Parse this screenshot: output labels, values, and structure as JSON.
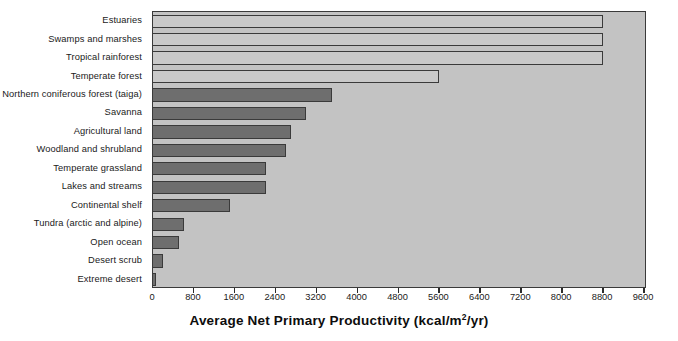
{
  "chart_data": {
    "type": "bar",
    "orientation": "horizontal",
    "title": "",
    "xlabel": "Average Net Primary Productivity (kcal/m2/yr)",
    "xlabel_parts": {
      "before": "Average Net Primary Productivity (kcal/m",
      "sup": "2",
      "after": "/yr)"
    },
    "ylabel": "",
    "categories": [
      "Estuaries",
      "Swamps and marshes",
      "Tropical rainforest",
      "Temperate forest",
      "Northern coniferous forest (taiga)",
      "Savanna",
      "Agricultural land",
      "Woodland and shrubland",
      "Temperate grassland",
      "Lakes and streams",
      "Continental shelf",
      "Tundra (arctic and alpine)",
      "Open ocean",
      "Desert scrub",
      "Extreme desert"
    ],
    "values": [
      8800,
      8800,
      8800,
      5600,
      3500,
      3000,
      2700,
      2600,
      2200,
      2200,
      1500,
      600,
      500,
      200,
      50
    ],
    "bar_styles": [
      "light",
      "light",
      "light",
      "light",
      "dark",
      "dark",
      "dark",
      "dark",
      "dark",
      "dark",
      "dark",
      "dark",
      "dark",
      "dark",
      "dark"
    ],
    "xlim": [
      0,
      9600
    ],
    "xticks": [
      0,
      800,
      1600,
      2400,
      3200,
      4000,
      4800,
      5600,
      6400,
      7200,
      8000,
      8800,
      9600
    ],
    "grid": false,
    "legend": null,
    "colors": {
      "plot_background": "#c3c3c3",
      "bar_dark": "#6e6e6e",
      "bar_light": "#c9c9c9",
      "axis": "#3a3a3a",
      "text": "#1a1a1a",
      "page_background": "#ffffff"
    }
  }
}
